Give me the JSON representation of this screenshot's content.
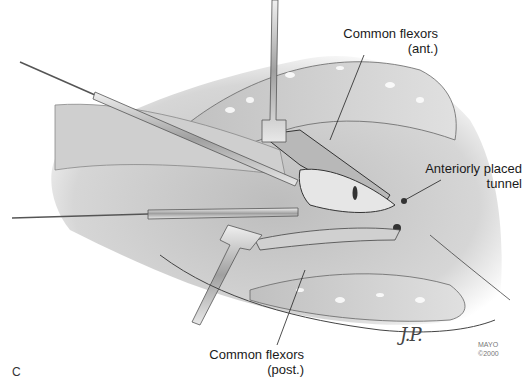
{
  "figure": {
    "panel_letter": "C",
    "credit_line1": "MAYO",
    "credit_line2": "©2000",
    "signature": "J.P.",
    "labels": [
      {
        "id": "common-flexors-ant",
        "line1": "Common flexors",
        "line2": "(ant.)"
      },
      {
        "id": "anteriorly-placed-tunnel",
        "line1": "Anteriorly placed",
        "line2": "tunnel"
      },
      {
        "id": "common-flexors-post",
        "line1": "Common flexors",
        "line2": "(post.)"
      }
    ],
    "colors": {
      "background": "#ffffff",
      "tissue_light": "#d9d9d9",
      "tissue_mid": "#a8a8a8",
      "tissue_dark": "#555555",
      "instrument": "#c8c8c8",
      "ink": "#1a1a1a"
    }
  }
}
